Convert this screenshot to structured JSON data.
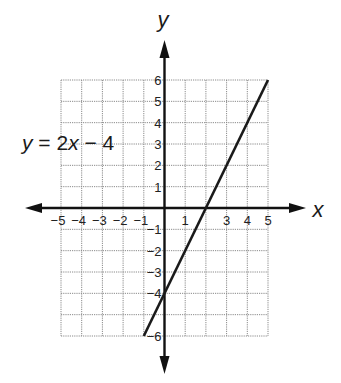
{
  "chart_data": {
    "type": "line",
    "title": "",
    "xlabel": "x",
    "ylabel": "y",
    "xlim": [
      -5,
      5
    ],
    "ylim": [
      -6,
      6
    ],
    "grid": true,
    "x_tick_labels": [
      "−5",
      "−4",
      "−3",
      "−2",
      "−1",
      "1",
      "3",
      "4",
      "5"
    ],
    "x_tick_values": [
      -5,
      -4,
      -3,
      -2,
      -1,
      1,
      3,
      4,
      5
    ],
    "y_tick_labels": [
      "6",
      "5",
      "4",
      "3",
      "2",
      "1",
      "−1",
      "−2",
      "−3",
      "−4",
      "−6"
    ],
    "y_tick_values": [
      6,
      5,
      4,
      3,
      2,
      1,
      -1,
      -2,
      -3,
      -4,
      -6
    ],
    "series": [
      {
        "name": "y = 2x − 4",
        "x": [
          -1,
          5
        ],
        "y": [
          -6,
          6
        ],
        "color": "#1a1a1a"
      }
    ],
    "annotations": [
      {
        "text": "y = 2x − 4",
        "position": "left-upper"
      }
    ]
  },
  "labels": {
    "x_axis": "x",
    "y_axis": "y",
    "equation_y": "y",
    "equation_rest": " = 2",
    "equation_x": "x",
    "equation_tail": " − 4"
  }
}
